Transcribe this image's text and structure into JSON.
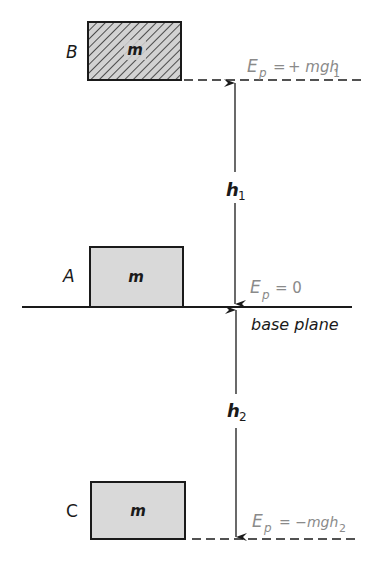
{
  "diagram": {
    "type": "potential-energy-reference-levels",
    "colors": {
      "ink": "#1a1a1a",
      "label_gray": "#8a8a8a",
      "box_fill": "#d9d9d9",
      "hatch_fill": "#cfcfcf"
    },
    "boxes": [
      {
        "id": "B",
        "label": "B",
        "mass_label": "m",
        "style": "hatched"
      },
      {
        "id": "A",
        "label": "A",
        "mass_label": "m",
        "style": "gray"
      },
      {
        "id": "C",
        "label": "C",
        "mass_label": "m",
        "style": "gray"
      }
    ],
    "energy_labels": {
      "top": {
        "symbol": "E",
        "subscript": "p",
        "expr": "= + mgh",
        "expr_sub": "1"
      },
      "middle": {
        "symbol": "E",
        "subscript": "p",
        "expr": "= 0",
        "expr_sub": ""
      },
      "bottom": {
        "symbol": "E",
        "subscript": "p",
        "expr": "= −mgh",
        "expr_sub": "2"
      }
    },
    "heights": {
      "h1": {
        "symbol": "h",
        "subscript": "1"
      },
      "h2": {
        "symbol": "h",
        "subscript": "2"
      }
    },
    "base_plane_label": "base plane"
  }
}
